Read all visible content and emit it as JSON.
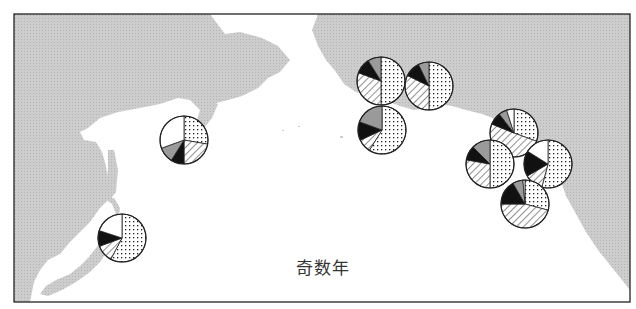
{
  "caption": "奇数年",
  "colors": {
    "land": "#c8c8c8",
    "sea": "#ffffff",
    "frame": "#222222",
    "black_slice": "#111111",
    "gray_slice": "#9a9a9a"
  },
  "legend_patterns": [
    "dots",
    "hatch",
    "black",
    "gray",
    "white"
  ],
  "pie_radius": 24,
  "chart_data": {
    "type": "pie",
    "title": "奇数年",
    "note": "Pie charts positioned on a North Pacific map; each slice angle estimated (degrees, clockwise from 12 o'clock)",
    "series_categories": [
      "dots",
      "hatch",
      "black",
      "gray",
      "white"
    ],
    "pies": [
      {
        "name": "kamchatka",
        "cx": 184,
        "cy": 140,
        "slices": [
          [
            "dots",
            0,
            100
          ],
          [
            "hatch",
            100,
            180
          ],
          [
            "black",
            180,
            212
          ],
          [
            "gray",
            212,
            250
          ],
          [
            "white",
            250,
            360
          ]
        ]
      },
      {
        "name": "japan",
        "cx": 122,
        "cy": 238,
        "slices": [
          [
            "dots",
            0,
            208
          ],
          [
            "hatch",
            208,
            250
          ],
          [
            "black",
            250,
            288
          ],
          [
            "white",
            288,
            360
          ]
        ]
      },
      {
        "name": "alaska-west-upper",
        "cx": 381,
        "cy": 81,
        "slices": [
          [
            "dots",
            0,
            180
          ],
          [
            "hatch",
            180,
            290
          ],
          [
            "black",
            290,
            328
          ],
          [
            "gray",
            328,
            360
          ]
        ]
      },
      {
        "name": "alaska-west-right",
        "cx": 429,
        "cy": 86,
        "slices": [
          [
            "dots",
            0,
            180
          ],
          [
            "hatch",
            180,
            296
          ],
          [
            "black",
            296,
            334
          ],
          [
            "gray",
            334,
            360
          ]
        ]
      },
      {
        "name": "alaska-west-lower",
        "cx": 382,
        "cy": 130,
        "slices": [
          [
            "dots",
            0,
            212
          ],
          [
            "hatch",
            212,
            245
          ],
          [
            "black",
            245,
            290
          ],
          [
            "gray",
            290,
            360
          ]
        ]
      },
      {
        "name": "gulf-upper",
        "cx": 514,
        "cy": 133,
        "slices": [
          [
            "dots",
            0,
            110
          ],
          [
            "hatch",
            110,
            292
          ],
          [
            "black",
            292,
            322
          ],
          [
            "gray",
            322,
            342
          ],
          [
            "white",
            342,
            360
          ]
        ]
      },
      {
        "name": "gulf-left",
        "cx": 490,
        "cy": 164,
        "slices": [
          [
            "dots",
            0,
            180
          ],
          [
            "hatch",
            180,
            280
          ],
          [
            "black",
            280,
            315
          ],
          [
            "gray",
            315,
            360
          ]
        ]
      },
      {
        "name": "gulf-right",
        "cx": 548,
        "cy": 164,
        "slices": [
          [
            "dots",
            0,
            195
          ],
          [
            "hatch",
            195,
            240
          ],
          [
            "black",
            240,
            302
          ],
          [
            "white",
            302,
            360
          ]
        ]
      },
      {
        "name": "gulf-lower",
        "cx": 525,
        "cy": 204,
        "slices": [
          [
            "dots",
            0,
            105
          ],
          [
            "hatch",
            105,
            270
          ],
          [
            "black",
            270,
            330
          ],
          [
            "gray",
            330,
            355
          ],
          [
            "white",
            355,
            360
          ]
        ]
      }
    ]
  }
}
